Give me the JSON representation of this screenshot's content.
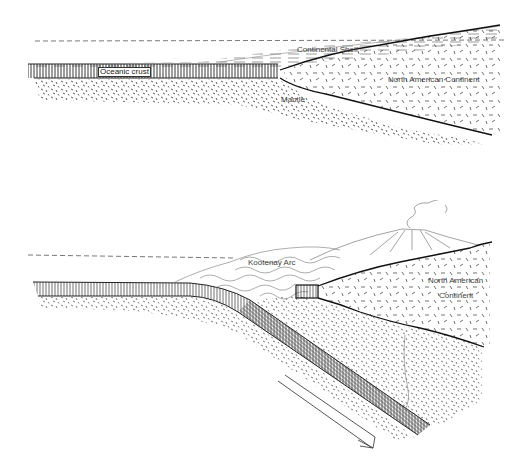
{
  "top_panel": {
    "title": "Passive margin before subduction",
    "labels": {
      "oceanic_crust": "Oceanic crust",
      "continental_shelf": "Continental Shelf",
      "north_american_continent": "North American Continent",
      "mantle": "Mantle"
    }
  },
  "bottom_panel": {
    "title": "Subduction beneath North American continent",
    "labels": {
      "kootenay_arc": "Kootenay Arc",
      "north_american": "North American",
      "continent": "Continent"
    },
    "arrow": "subduction-direction"
  },
  "colors": {
    "ink": "#222222",
    "stipple": "#333333",
    "label_text": "#444444",
    "background": "#ffffff"
  }
}
